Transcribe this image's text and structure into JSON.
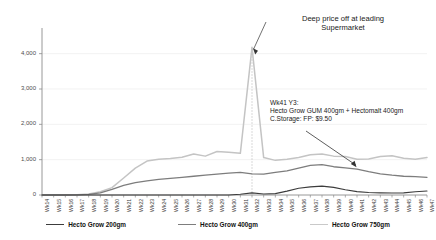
{
  "chart_data": {
    "type": "line",
    "title": "",
    "xlabel": "",
    "ylabel": "",
    "ylim": [
      0,
      4500
    ],
    "yticks": [
      0,
      1000,
      2000,
      3000,
      4000
    ],
    "ytick_labels": [
      "0",
      "1,000",
      "2,000",
      "3,000",
      "4,000"
    ],
    "grid": true,
    "legend_position": "bottom",
    "categories": [
      "Wk14",
      "Wk15",
      "Wk16",
      "Wk17",
      "Wk18",
      "Wk19",
      "Wk20",
      "Wk21",
      "Wk22",
      "Wk23",
      "Wk24",
      "Wk25",
      "Wk26",
      "Wk27",
      "Wk28",
      "Wk29",
      "Wk30",
      "Wk31",
      "Wk32",
      "Wk33",
      "Wk34",
      "Wk35",
      "Wk36",
      "Wk37",
      "Wk38",
      "Wk39",
      "Wk40",
      "Wk41",
      "Wk42",
      "Wk43",
      "Wk44",
      "Wk45",
      "Wk46",
      "Wk47"
    ],
    "series": [
      {
        "name": "Hecto Grow 200gm",
        "color": "#3c3c3c",
        "width": 1.1,
        "values": [
          0,
          0,
          0,
          0,
          0,
          0,
          0,
          0,
          0,
          0,
          0,
          0,
          0,
          0,
          0,
          0,
          0,
          20,
          60,
          30,
          40,
          110,
          190,
          230,
          250,
          215,
          150,
          95,
          70,
          60,
          55,
          60,
          90,
          115
        ]
      },
      {
        "name": "Hecto Grow 400gm",
        "color": "#7d7d7d",
        "width": 1.3,
        "values": [
          0,
          0,
          0,
          5,
          15,
          60,
          160,
          270,
          350,
          400,
          440,
          470,
          500,
          530,
          560,
          590,
          620,
          640,
          600,
          590,
          640,
          680,
          760,
          840,
          860,
          800,
          770,
          730,
          660,
          600,
          560,
          530,
          520,
          500
        ]
      },
      {
        "name": "Hecto Grow 750gm",
        "color": "#c4c4c4",
        "width": 1.5,
        "values": [
          0,
          0,
          0,
          10,
          30,
          90,
          210,
          480,
          760,
          960,
          1010,
          1030,
          1070,
          1160,
          1100,
          1230,
          1210,
          1180,
          4180,
          1060,
          980,
          1010,
          1060,
          1140,
          1160,
          1100,
          1090,
          1010,
          1020,
          1090,
          1110,
          1040,
          1010,
          1060
        ]
      }
    ],
    "annotations": [
      {
        "id": "deep-price-annotation",
        "lines": [
          "Deep price off at leading",
          "Supermarket"
        ],
        "points_to_category": "Wk32"
      },
      {
        "id": "wk41-annotation",
        "lines": [
          "Wk41 Y3:",
          "Hecto Grow GUM 400gm + Hectomalt 400gm",
          "C.Storage: FP: $9.50"
        ],
        "points_to_category": "Wk41"
      }
    ],
    "reference_line": {
      "category": "Wk32",
      "style": "dotted",
      "color": "#bdbdbd"
    }
  },
  "legend": {
    "items": [
      {
        "label": "Hecto Grow 200gm",
        "color": "#3c3c3c",
        "width": "1.6px"
      },
      {
        "label": "Hecto Grow 400gm",
        "color": "#7d7d7d",
        "width": "1.6px"
      },
      {
        "label": "Hecto Grow 750gm",
        "color": "#c9c9c9",
        "width": "1.6px"
      }
    ]
  }
}
